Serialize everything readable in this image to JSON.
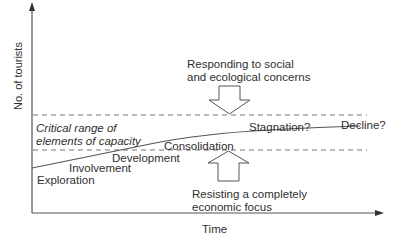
{
  "axes": {
    "y_label": "No. of tourists",
    "x_label": "Time"
  },
  "capacity_band": {
    "label_line1": "Critical range of",
    "label_line2": "elements of capacity"
  },
  "stages": {
    "exploration": "Exploration",
    "involvement": "Involvement",
    "development": "Development",
    "consolidation": "Consolidation",
    "stagnation": "Stagnation?",
    "decline": "Decline?"
  },
  "top_annotation": {
    "line1": "Responding to social",
    "line2": "and ecological concerns",
    "arrow": "down-arrow"
  },
  "bottom_annotation": {
    "line1": "Resisting a completely",
    "line2": "economic focus",
    "arrow": "up-arrow"
  },
  "colors": {
    "line": "#555555",
    "text": "#2f2f2f",
    "background": "#ffffff"
  }
}
